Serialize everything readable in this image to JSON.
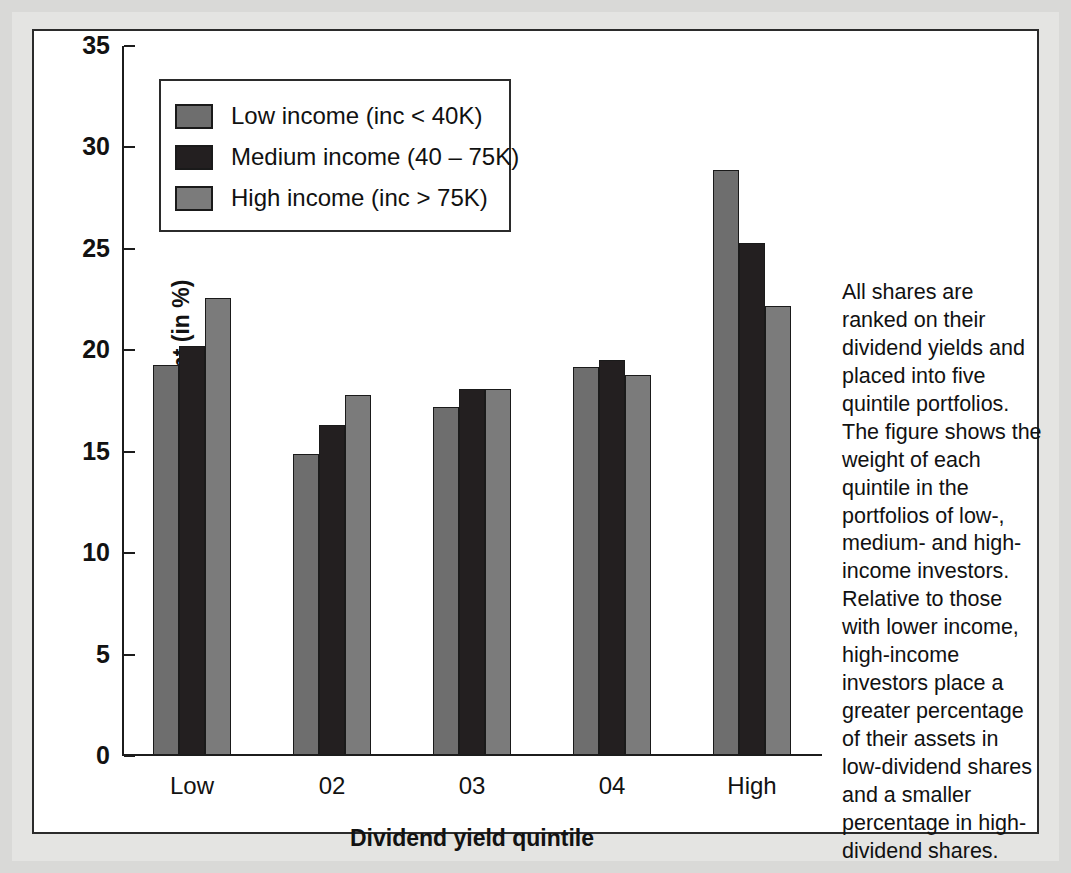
{
  "chart_data": {
    "type": "bar",
    "title": "",
    "xlabel": "Dividend yield quintile",
    "ylabel": "Portfolio weight (in %)",
    "categories": [
      "Low",
      "02",
      "03",
      "04",
      "High"
    ],
    "ylim": [
      0,
      35
    ],
    "yticks": [
      0,
      5,
      10,
      15,
      20,
      25,
      30,
      35
    ],
    "grid": false,
    "legend_position": "top-left",
    "series": [
      {
        "name": "Low income (inc < 40K)",
        "color": "#6e6e6e",
        "values": [
          19.2,
          14.8,
          17.1,
          19.1,
          28.8
        ]
      },
      {
        "name": "Medium income (40 – 75K)",
        "color": "#231f20",
        "values": [
          20.1,
          16.2,
          18.0,
          19.4,
          25.2
        ]
      },
      {
        "name": "High income (inc > 75K)",
        "color": "#7b7b7b",
        "values": [
          22.5,
          17.7,
          18.0,
          18.7,
          22.1
        ]
      }
    ],
    "annotation": "All shares are ranked on their dividend yields and placed into five quintile portfolios. The figure shows the weight of each quintile in the portfolios of low-, medium- and high-income investors. Relative to those with lower income, high-income investors place a greater percentage of their assets in low-dividend shares and a smaller percentage in high-dividend shares."
  },
  "colors": {
    "page_background": "#d9d9d7",
    "panel_background": "#ffffff",
    "axis": "#1c1c1c",
    "text": "#111111"
  }
}
